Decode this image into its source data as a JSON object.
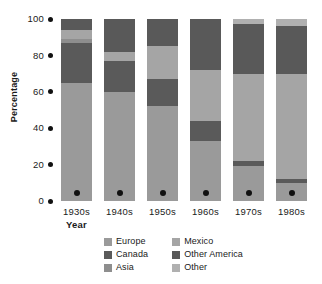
{
  "chart_data": {
    "type": "bar",
    "stacked": true,
    "title": "",
    "xlabel": "Year",
    "ylabel": "Percentage",
    "categories": [
      "1930s",
      "1940s",
      "1950s",
      "1960s",
      "1970s",
      "1980s"
    ],
    "ylim": [
      0,
      100
    ],
    "yticks": [
      0,
      20,
      40,
      60,
      80,
      100
    ],
    "ytick_labels": [
      "0",
      "20",
      "40",
      "60",
      "80",
      "100"
    ],
    "grid": false,
    "legend_position": "bottom",
    "series": [
      {
        "name": "Europe",
        "color": "#9a9a9a",
        "values": [
          65,
          60,
          52,
          33,
          19,
          10
        ]
      },
      {
        "name": "Canada",
        "color": "#5a5a5a",
        "values": [
          22,
          17,
          15,
          11,
          3,
          2
        ]
      },
      {
        "name": "Asia",
        "color": "#8e8e8e",
        "values": [
          2,
          0,
          0,
          0,
          0,
          0
        ]
      },
      {
        "name": "Mexico",
        "color": "#a5a5a5",
        "values": [
          5,
          5,
          18,
          28,
          48,
          58
        ]
      },
      {
        "name": "Other America",
        "color": "#595959",
        "values": [
          6,
          18,
          15,
          28,
          27,
          26
        ]
      },
      {
        "name": "Other",
        "color": "#b0b0b0",
        "values": [
          0,
          0,
          0,
          0,
          3,
          4
        ]
      }
    ]
  },
  "axes": {
    "y_title": "Percentage",
    "x_title": "Year"
  },
  "legend": {
    "columns": [
      [
        {
          "label": "Europe",
          "color": "#9a9a9a"
        },
        {
          "label": "Canada",
          "color": "#5a5a5a"
        },
        {
          "label": "Asia",
          "color": "#8e8e8e"
        }
      ],
      [
        {
          "label": "Mexico",
          "color": "#a5a5a5"
        },
        {
          "label": "Other America",
          "color": "#595959"
        },
        {
          "label": "Other",
          "color": "#b0b0b0"
        }
      ]
    ]
  },
  "colors": {
    "background": "#ffffff",
    "text": "#1a1a1a",
    "marker": "#111111"
  }
}
